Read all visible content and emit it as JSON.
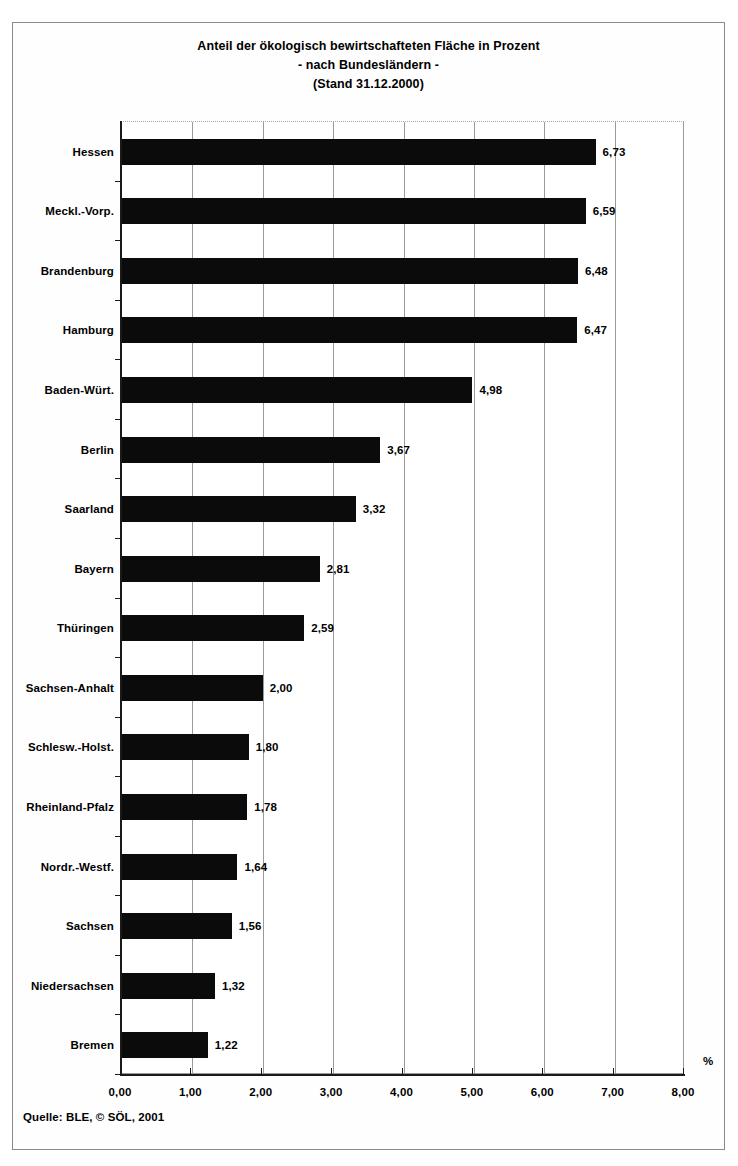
{
  "title": {
    "line1": "Anteil der ökologisch bewirtschafteten Fläche in Prozent",
    "line2": "- nach Bundesländern -",
    "line3": "(Stand 31.12.2000)"
  },
  "source_note": "Quelle: BLE, © SÖL, 2001",
  "axis": {
    "unit_label": "%",
    "tick_labels": [
      "0,00",
      "1,00",
      "2,00",
      "3,00",
      "4,00",
      "5,00",
      "6,00",
      "7,00",
      "8,00"
    ]
  },
  "colors": {
    "bar": "#0b0b0b",
    "gridline": "#9a9a9a",
    "axis": "#1a1a1a",
    "frame": "#8a8a8a",
    "background": "#ffffff"
  },
  "chart_data": {
    "type": "bar",
    "orientation": "horizontal",
    "title": "Anteil der ökologisch bewirtschafteten Fläche in Prozent - nach Bundesländern - (Stand 31.12.2000)",
    "xlabel": "%",
    "ylabel": "",
    "xlim": [
      0,
      8
    ],
    "xticks": [
      0,
      1,
      2,
      3,
      4,
      5,
      6,
      7,
      8
    ],
    "grid": true,
    "legend": false,
    "decimal_separator": ",",
    "categories": [
      "Hessen",
      "Meckl.-Vorp.",
      "Brandenburg",
      "Hamburg",
      "Baden-Würt.",
      "Berlin",
      "Saarland",
      "Bayern",
      "Thüringen",
      "Sachsen-Anhalt",
      "Schlesw.-Holst.",
      "Rheinland-Pfalz",
      "Nordr.-Westf.",
      "Sachsen",
      "Niedersachsen",
      "Bremen"
    ],
    "values": [
      6.73,
      6.59,
      6.48,
      6.47,
      4.98,
      3.67,
      3.32,
      2.81,
      2.59,
      2.0,
      1.8,
      1.78,
      1.64,
      1.56,
      1.32,
      1.22
    ],
    "value_labels": [
      "6,73",
      "6,59",
      "6,48",
      "6,47",
      "4,98",
      "3,67",
      "3,32",
      "2,81",
      "2,59",
      "2,00",
      "1,80",
      "1,78",
      "1,64",
      "1,56",
      "1,32",
      "1,22"
    ]
  }
}
